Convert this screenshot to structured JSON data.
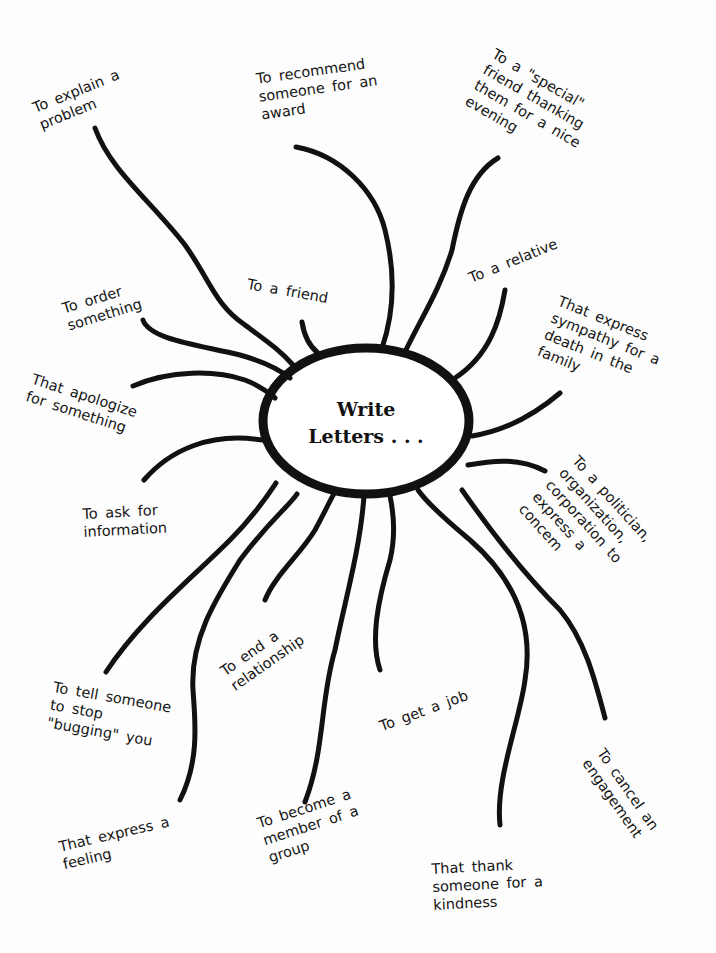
{
  "diagram": {
    "type": "mind-map",
    "center": {
      "line1": "Write",
      "line2": "Letters . . ."
    },
    "branches": [
      {
        "id": "explain-problem",
        "text": "To explain a\nproblem"
      },
      {
        "id": "recommend-award",
        "text": "To recommend\nsomeone for an\naward"
      },
      {
        "id": "special-friend",
        "text": "To a \"special\"\nfriend thanking\nthem for a nice\nevening"
      },
      {
        "id": "friend",
        "text": "To a friend"
      },
      {
        "id": "order-something",
        "text": "To order\nsomething"
      },
      {
        "id": "relative",
        "text": "To a relative"
      },
      {
        "id": "sympathy",
        "text": "That express\nsympathy for a\ndeath in the\nfamily"
      },
      {
        "id": "apologize",
        "text": "That apologize\nfor something"
      },
      {
        "id": "ask-information",
        "text": "To ask for\ninformation"
      },
      {
        "id": "politician",
        "text": "To a politician,\norganization,\ncorporation to\nexpress a\nconcem"
      },
      {
        "id": "end-relationship",
        "text": "To end a\nrelationship"
      },
      {
        "id": "tell-stop",
        "text": "To tell someone\nto stop\n\"bugging\" you"
      },
      {
        "id": "get-job",
        "text": "To get a job"
      },
      {
        "id": "cancel-engagement",
        "text": "To cancel an\nengagement"
      },
      {
        "id": "express-feeling",
        "text": "That express a\nfeeling"
      },
      {
        "id": "become-member",
        "text": "To become a\nmember of a\ngroup"
      },
      {
        "id": "thank-kindness",
        "text": "That thank\nsomeone for a\nkindness"
      }
    ],
    "colors": {
      "ink": "#111111",
      "paper": "#fdfdfd"
    }
  }
}
